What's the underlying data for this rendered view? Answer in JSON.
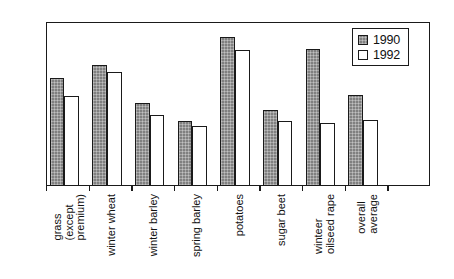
{
  "chart_data": {
    "type": "bar",
    "title": "",
    "subtitle": "",
    "xlabel": "",
    "ylabel": "",
    "ylim": [
      0,
      250
    ],
    "yticks": [
      0,
      50,
      100,
      150,
      200,
      250
    ],
    "grid": false,
    "legend_position": "top-right",
    "categories": [
      "grass (except premium)",
      "winter wheat",
      "winter barley",
      "spring barley",
      "potatoes",
      "sugar beet",
      "winteer oilseed rape",
      "overall average"
    ],
    "category_lines": [
      [
        "grass",
        "(except",
        "premium)"
      ],
      [
        "winter wheat"
      ],
      [
        "winter barley"
      ],
      [
        "spring barley"
      ],
      [
        "potatoes"
      ],
      [
        "sugar beet"
      ],
      [
        "winteer",
        "oilseed rape"
      ],
      [
        "overall",
        "average"
      ]
    ],
    "series": [
      {
        "name": "1990",
        "color": "#808080",
        "values": [
          165,
          184,
          126,
          99,
          227,
          116,
          209,
          138
        ]
      },
      {
        "name": "1992",
        "color": "#ffffff",
        "values": [
          137,
          174,
          109,
          92,
          207,
          99,
          96,
          101
        ]
      }
    ]
  },
  "legend": {
    "entries": [
      {
        "label": "1990"
      },
      {
        "label": "1992"
      }
    ]
  },
  "axis": {
    "y_tick_labels": [
      "0",
      "50",
      "100",
      "150",
      "200",
      "250"
    ]
  }
}
